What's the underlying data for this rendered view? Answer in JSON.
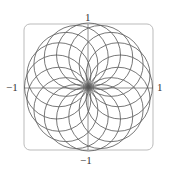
{
  "chart_data": {
    "type": "line",
    "title": "",
    "curves": {
      "count": 16,
      "formula": "r = cos(theta - phi_k)",
      "phase_step_deg": 22.5,
      "radius": 1
    },
    "xlim": [
      -1,
      1
    ],
    "ylim": [
      -1,
      1
    ],
    "axis_labels": {
      "top": "1",
      "bottom": "−1",
      "left": "−1",
      "right": "1"
    },
    "grid": false,
    "frame": "rounded",
    "colors": {
      "curve": "#555555",
      "axis": "#777777",
      "frame": "#bbbbbb"
    }
  }
}
